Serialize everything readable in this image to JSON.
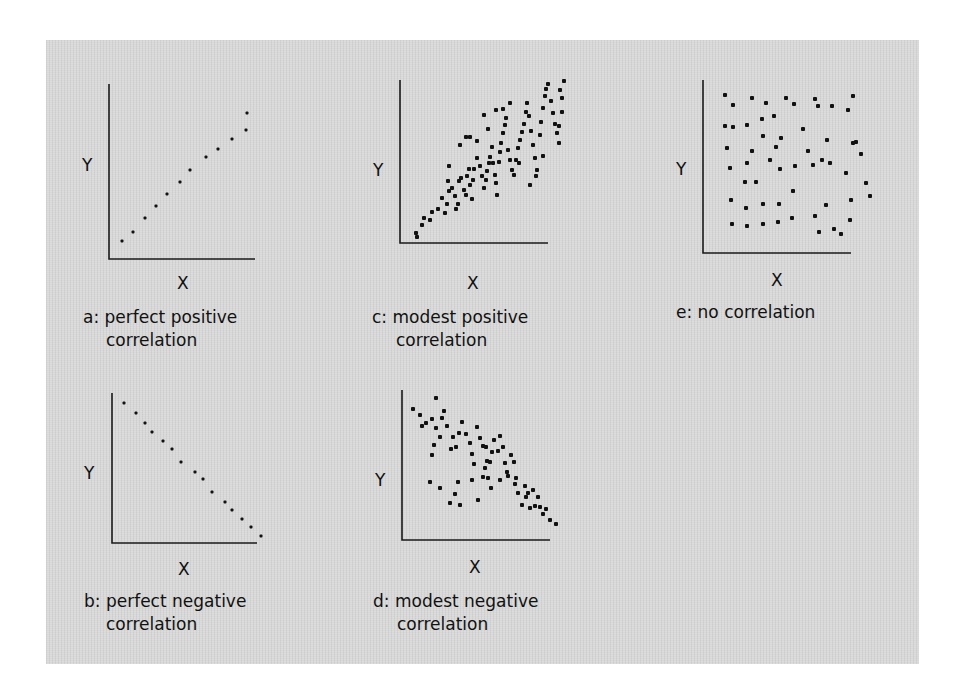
{
  "figure": {
    "background_color": "#d8d8d8",
    "ink_color": "#111111"
  },
  "panels": [
    {
      "id": "a",
      "x_label": "X",
      "y_label": "Y",
      "caption_line1": "a: perfect positive",
      "caption_line2": "correlation"
    },
    {
      "id": "b",
      "x_label": "X",
      "y_label": "Y",
      "caption_line1": "b: perfect negative",
      "caption_line2": "correlation"
    },
    {
      "id": "c",
      "x_label": "X",
      "y_label": "Y",
      "caption_line1": "c: modest positive",
      "caption_line2": "correlation"
    },
    {
      "id": "d",
      "x_label": "X",
      "y_label": "Y",
      "caption_line1": "d: modest negative",
      "caption_line2": "correlation"
    },
    {
      "id": "e",
      "x_label": "X",
      "y_label": "Y",
      "caption_line1": "e: no correlation",
      "caption_line2": ""
    }
  ],
  "chart_data": [
    {
      "type": "scatter",
      "title": "a: perfect positive correlation",
      "xlabel": "X",
      "ylabel": "Y",
      "grid": false,
      "axis": {
        "x0": 109,
        "y0": 259,
        "x1": 255,
        "ytop": 84
      },
      "points": [
        [
          122,
          241
        ],
        [
          133,
          232
        ],
        [
          145,
          218
        ],
        [
          156,
          206
        ],
        [
          167,
          194
        ],
        [
          180,
          182
        ],
        [
          190,
          170
        ],
        [
          206,
          157
        ],
        [
          218,
          149
        ],
        [
          232,
          139
        ],
        [
          246,
          130
        ],
        [
          247,
          113
        ]
      ],
      "correlation": "perfect positive"
    },
    {
      "type": "scatter",
      "title": "b: perfect negative correlation",
      "xlabel": "X",
      "ylabel": "Y",
      "grid": false,
      "axis": {
        "x0": 112,
        "y0": 543,
        "x1": 257,
        "ytop": 393
      },
      "points": [
        [
          124,
          403
        ],
        [
          136,
          413
        ],
        [
          145,
          423
        ],
        [
          152,
          432
        ],
        [
          163,
          441
        ],
        [
          172,
          449
        ],
        [
          181,
          462
        ],
        [
          195,
          472
        ],
        [
          203,
          479
        ],
        [
          212,
          492
        ],
        [
          225,
          502
        ],
        [
          232,
          510
        ],
        [
          242,
          519
        ],
        [
          251,
          527
        ],
        [
          261,
          536
        ]
      ],
      "correlation": "perfect negative"
    },
    {
      "type": "scatter",
      "title": "c: modest positive correlation",
      "xlabel": "X",
      "ylabel": "Y",
      "grid": false,
      "axis": {
        "x0": 400,
        "y0": 243,
        "x1": 548,
        "ytop": 80
      },
      "points": [
        [
          417,
          237
        ],
        [
          416,
          233
        ],
        [
          422,
          225
        ],
        [
          424,
          218
        ],
        [
          430,
          220
        ],
        [
          432,
          212
        ],
        [
          438,
          209
        ],
        [
          442,
          198
        ],
        [
          445,
          213
        ],
        [
          447,
          204
        ],
        [
          449,
          191
        ],
        [
          448,
          181
        ],
        [
          452,
          188
        ],
        [
          455,
          196
        ],
        [
          456,
          209
        ],
        [
          458,
          204
        ],
        [
          459,
          181
        ],
        [
          461,
          178
        ],
        [
          464,
          190
        ],
        [
          466,
          195
        ],
        [
          467,
          176
        ],
        [
          469,
          169
        ],
        [
          470,
          185
        ],
        [
          472,
          199
        ],
        [
          473,
          180
        ],
        [
          474,
          169
        ],
        [
          477,
          158
        ],
        [
          477,
          141
        ],
        [
          480,
          166
        ],
        [
          482,
          176
        ],
        [
          484,
          188
        ],
        [
          486,
          180
        ],
        [
          487,
          171
        ],
        [
          489,
          163
        ],
        [
          490,
          157
        ],
        [
          492,
          147
        ],
        [
          493,
          163
        ],
        [
          495,
          175
        ],
        [
          496,
          183
        ],
        [
          497,
          195
        ],
        [
          499,
          162
        ],
        [
          500,
          152
        ],
        [
          501,
          143
        ],
        [
          503,
          133
        ],
        [
          505,
          125
        ],
        [
          506,
          118
        ],
        [
          508,
          150
        ],
        [
          510,
          160
        ],
        [
          512,
          170
        ],
        [
          514,
          175
        ],
        [
          516,
          160
        ],
        [
          518,
          148
        ],
        [
          520,
          140
        ],
        [
          522,
          132
        ],
        [
          524,
          124
        ],
        [
          526,
          112
        ],
        [
          527,
          103
        ],
        [
          529,
          116
        ],
        [
          531,
          131
        ],
        [
          533,
          145
        ],
        [
          535,
          158
        ],
        [
          537,
          170
        ],
        [
          540,
          135
        ],
        [
          541,
          122
        ],
        [
          543,
          108
        ],
        [
          545,
          96
        ],
        [
          546,
          89
        ],
        [
          548,
          84
        ],
        [
          551,
          101
        ],
        [
          553,
          113
        ],
        [
          555,
          124
        ],
        [
          557,
          133
        ],
        [
          559,
          143
        ],
        [
          560,
          90
        ],
        [
          562,
          98
        ],
        [
          564,
          81
        ],
        [
          562,
          112
        ],
        [
          559,
          126
        ],
        [
          543,
          156
        ],
        [
          536,
          176
        ],
        [
          530,
          185
        ],
        [
          519,
          163
        ],
        [
          510,
          103
        ],
        [
          503,
          109
        ],
        [
          496,
          110
        ],
        [
          488,
          129
        ],
        [
          484,
          115
        ],
        [
          470,
          137
        ],
        [
          460,
          145
        ],
        [
          449,
          166
        ],
        [
          466,
          137
        ]
      ],
      "correlation": "modest positive"
    },
    {
      "type": "scatter",
      "title": "d: modest negative correlation",
      "xlabel": "X",
      "ylabel": "Y",
      "grid": false,
      "axis": {
        "x0": 402,
        "y0": 540,
        "x1": 550,
        "ytop": 390
      },
      "points": [
        [
          413,
          409
        ],
        [
          420,
          415
        ],
        [
          426,
          423
        ],
        [
          422,
          426
        ],
        [
          432,
          419
        ],
        [
          436,
          428
        ],
        [
          442,
          418
        ],
        [
          447,
          426
        ],
        [
          453,
          437
        ],
        [
          451,
          449
        ],
        [
          440,
          437
        ],
        [
          434,
          445
        ],
        [
          432,
          455
        ],
        [
          456,
          447
        ],
        [
          459,
          433
        ],
        [
          462,
          422
        ],
        [
          466,
          434
        ],
        [
          470,
          443
        ],
        [
          472,
          454
        ],
        [
          474,
          464
        ],
        [
          477,
          427
        ],
        [
          480,
          438
        ],
        [
          483,
          446
        ],
        [
          486,
          447
        ],
        [
          487,
          461
        ],
        [
          485,
          468
        ],
        [
          483,
          477
        ],
        [
          488,
          478
        ],
        [
          490,
          462
        ],
        [
          492,
          452
        ],
        [
          494,
          440
        ],
        [
          498,
          451
        ],
        [
          500,
          436
        ],
        [
          503,
          447
        ],
        [
          505,
          463
        ],
        [
          507,
          472
        ],
        [
          508,
          476
        ],
        [
          511,
          455
        ],
        [
          514,
          462
        ],
        [
          516,
          478
        ],
        [
          518,
          493
        ],
        [
          522,
          505
        ],
        [
          526,
          497
        ],
        [
          528,
          493
        ],
        [
          530,
          508
        ],
        [
          533,
          490
        ],
        [
          535,
          506
        ],
        [
          538,
          497
        ],
        [
          540,
          507
        ],
        [
          543,
          514
        ],
        [
          546,
          509
        ],
        [
          550,
          520
        ],
        [
          556,
          524
        ],
        [
          500,
          480
        ],
        [
          491,
          488
        ],
        [
          472,
          480
        ],
        [
          458,
          482
        ],
        [
          455,
          494
        ],
        [
          450,
          503
        ],
        [
          440,
          488
        ],
        [
          430,
          482
        ],
        [
          460,
          505
        ],
        [
          478,
          500
        ],
        [
          515,
          484
        ],
        [
          525,
          486
        ],
        [
          436,
          398
        ],
        [
          444,
          411
        ]
      ],
      "correlation": "modest negative"
    },
    {
      "type": "scatter",
      "title": "e: no correlation",
      "xlabel": "X",
      "ylabel": "Y",
      "grid": false,
      "axis": {
        "x0": 703,
        "y0": 253,
        "x1": 851,
        "ytop": 80
      },
      "points": [
        [
          725,
          95
        ],
        [
          733,
          105
        ],
        [
          752,
          98
        ],
        [
          766,
          103
        ],
        [
          786,
          98
        ],
        [
          794,
          104
        ],
        [
          815,
          99
        ],
        [
          818,
          106
        ],
        [
          832,
          106
        ],
        [
          853,
          96
        ],
        [
          848,
          110
        ],
        [
          725,
          126
        ],
        [
          733,
          127
        ],
        [
          747,
          125
        ],
        [
          762,
          119
        ],
        [
          774,
          116
        ],
        [
          803,
          129
        ],
        [
          763,
          136
        ],
        [
          781,
          138
        ],
        [
          727,
          148
        ],
        [
          752,
          151
        ],
        [
          776,
          147
        ],
        [
          808,
          151
        ],
        [
          827,
          140
        ],
        [
          853,
          143
        ],
        [
          861,
          154
        ],
        [
          856,
          142
        ],
        [
          830,
          163
        ],
        [
          822,
          160
        ],
        [
          747,
          163
        ],
        [
          730,
          168
        ],
        [
          770,
          160
        ],
        [
          780,
          169
        ],
        [
          795,
          166
        ],
        [
          813,
          165
        ],
        [
          846,
          173
        ],
        [
          745,
          182
        ],
        [
          756,
          182
        ],
        [
          793,
          191
        ],
        [
          866,
          183
        ],
        [
          870,
          196
        ],
        [
          731,
          200
        ],
        [
          779,
          204
        ],
        [
          763,
          204
        ],
        [
          826,
          205
        ],
        [
          851,
          200
        ],
        [
          746,
          208
        ],
        [
          792,
          218
        ],
        [
          763,
          224
        ],
        [
          732,
          224
        ],
        [
          778,
          222
        ],
        [
          815,
          216
        ],
        [
          747,
          226
        ],
        [
          834,
          229
        ],
        [
          841,
          234
        ],
        [
          819,
          232
        ],
        [
          850,
          220
        ]
      ],
      "correlation": "none"
    }
  ]
}
